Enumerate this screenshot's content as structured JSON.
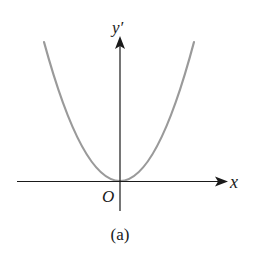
{
  "figure": {
    "caption": "(a)",
    "curve_description": "Upward-opening parabola with vertex at the origin",
    "colors": {
      "axis": "#1a1a1a",
      "curve": "#9a9a9a",
      "background": "#ffffff"
    },
    "axes": {
      "x_label": "x",
      "y_label": "y′",
      "origin_label": "O"
    }
  }
}
